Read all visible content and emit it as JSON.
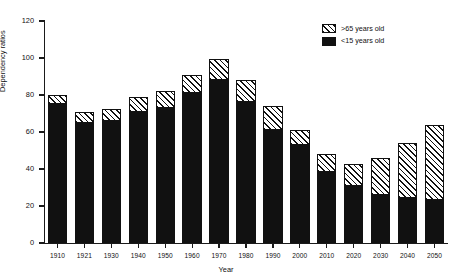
{
  "chart_data": {
    "type": "bar",
    "title": "",
    "xlabel": "Year",
    "ylabel": "Dependency ratios",
    "ylim": [
      0,
      120
    ],
    "yticks": [
      0,
      20,
      40,
      60,
      80,
      100,
      120
    ],
    "grid": false,
    "stacked": true,
    "legend_position": "top-right",
    "categories": [
      "1910",
      "1921",
      "1930",
      "1940",
      "1950",
      "1960",
      "1970",
      "1980",
      "1990",
      "2000",
      "2010",
      "2020",
      "2030",
      "2040",
      "2050"
    ],
    "series": [
      {
        "name": "<15 years old",
        "style": "solid-black",
        "color": "#111111",
        "values": [
          75,
          65,
          66,
          71,
          73,
          81,
          88,
          76,
          61,
          53,
          38.5,
          31,
          26,
          24.5,
          23.5
        ]
      },
      {
        "name": ">65 years old",
        "style": "diagonal-hatch",
        "color": "#ffffff",
        "values": [
          5,
          6,
          6.5,
          8,
          9,
          10,
          11.5,
          12,
          13,
          8,
          9.5,
          11.5,
          20,
          29.5,
          40.5
        ]
      }
    ],
    "totals": [
      80,
      71,
      72.5,
      79,
      82,
      91,
      99.5,
      88,
      74,
      61,
      48,
      42.5,
      46,
      54,
      64
    ]
  },
  "legend": {
    "items": [
      {
        "label": ">65 years old",
        "swatch": "hatched-swatch"
      },
      {
        "label": "<15 years old",
        "swatch": "black-swatch"
      }
    ]
  },
  "axes": {
    "y_title": "Dependency ratios",
    "x_title": "Year"
  }
}
